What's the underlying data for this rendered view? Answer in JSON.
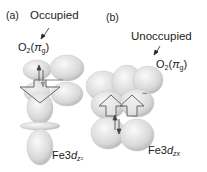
{
  "panel_a": {
    "tag": "(a)",
    "state_label": "Occupied",
    "orbital_o2": "O",
    "orbital_o2_sub": "2",
    "orbital_o2_paren_open": "(",
    "orbital_o2_pi": "π",
    "orbital_o2_pi_sub": "g",
    "orbital_o2_paren_close": ")",
    "fe_label": "Fe3",
    "fe_d": "d",
    "fe_sub": "z²"
  },
  "panel_b": {
    "tag": "(b)",
    "state_label": "Unoccupied",
    "orbital_o2": "O",
    "orbital_o2_sub": "2",
    "orbital_o2_paren_open": "(",
    "orbital_o2_pi": "π",
    "orbital_o2_pi_sub": "g",
    "orbital_o2_paren_close": ")",
    "fe_label": "Fe3",
    "fe_d": "d",
    "fe_sub": "zx",
    "minus_sign": "−"
  },
  "colors": {
    "lobe_light": "#f2f2f2",
    "lobe_dark": "#b8b8b8",
    "arrow_stroke": "#666666",
    "text": "#222222"
  }
}
